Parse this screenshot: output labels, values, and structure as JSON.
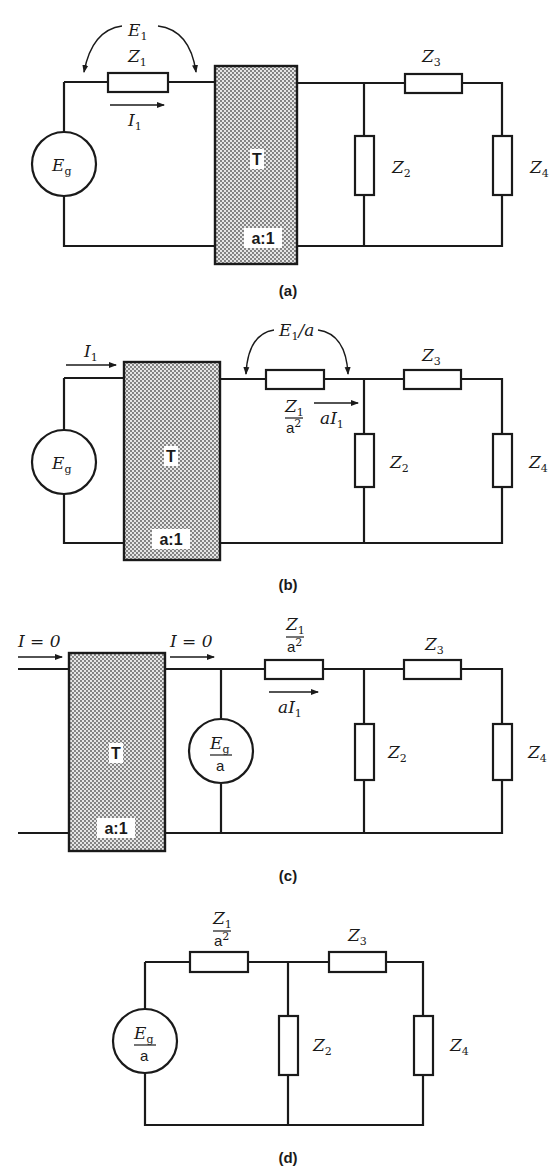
{
  "figure": {
    "panels": [
      {
        "caption": "(a)",
        "voltage_label": "E",
        "voltage_sub": "1",
        "z1_label": "Z",
        "z1_sub": "1",
        "current_label": "I",
        "current_sub": "1",
        "source_label": "E",
        "source_sub": "g",
        "transformer_label": "T",
        "transformer_ratio": "a:1",
        "z2_label": "Z",
        "z2_sub": "2",
        "z3_label": "Z",
        "z3_sub": "3",
        "z4_label": "Z",
        "z4_sub": "4"
      },
      {
        "caption": "(b)",
        "input_current_label": "I",
        "input_current_sub": "1",
        "source_label": "E",
        "source_sub": "g",
        "transformer_label": "T",
        "transformer_ratio": "a:1",
        "voltage_label": "E",
        "voltage_sub": "1",
        "voltage_suffix": "/a",
        "z1_num": "Z",
        "z1_num_sub": "1",
        "z1_den": "a",
        "z1_den_sup": "2",
        "current_label": "aI",
        "current_sub": "1",
        "z2_label": "Z",
        "z2_sub": "2",
        "z3_label": "Z",
        "z3_sub": "3",
        "z4_label": "Z",
        "z4_sub": "4"
      },
      {
        "caption": "(c)",
        "input_current_label": "I = 0",
        "output_current_label": "I = 0",
        "transformer_label": "T",
        "transformer_ratio": "a:1",
        "source_num": "E",
        "source_num_sub": "g",
        "source_den": "a",
        "z1_num": "Z",
        "z1_num_sub": "1",
        "z1_den": "a",
        "z1_den_sup": "2",
        "current_label": "aI",
        "current_sub": "1",
        "z2_label": "Z",
        "z2_sub": "2",
        "z3_label": "Z",
        "z3_sub": "3",
        "z4_label": "Z",
        "z4_sub": "4"
      },
      {
        "caption": "(d)",
        "source_num": "E",
        "source_num_sub": "g",
        "source_den": "a",
        "z1_num": "Z",
        "z1_num_sub": "1",
        "z1_den": "a",
        "z1_den_sup": "2",
        "z2_label": "Z",
        "z2_sub": "2",
        "z3_label": "Z",
        "z3_sub": "3",
        "z4_label": "Z",
        "z4_sub": "4"
      }
    ],
    "colors": {
      "line": "#1a1a1a",
      "transformer_fill": "#bdbdbd",
      "background": "#ffffff"
    }
  }
}
